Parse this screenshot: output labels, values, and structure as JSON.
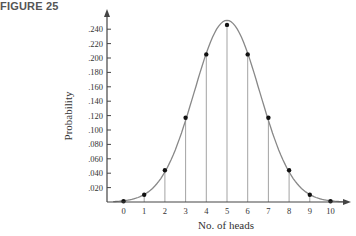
{
  "figure_label": "FIGURE 25",
  "chart_data": {
    "type": "scatter",
    "title": "",
    "xlabel": "No. of heads",
    "ylabel": "Probability",
    "x": [
      0,
      1,
      2,
      3,
      4,
      5,
      6,
      7,
      8,
      9,
      10
    ],
    "values": [
      0.001,
      0.01,
      0.044,
      0.117,
      0.205,
      0.246,
      0.205,
      0.117,
      0.044,
      0.01,
      0.001
    ],
    "x_tick_labels": [
      "0",
      "1",
      "2",
      "3",
      "4",
      "5",
      "6",
      "7",
      "8",
      "9",
      "10"
    ],
    "y_tick_labels": [
      ".020",
      ".040",
      ".060",
      ".080",
      ".100",
      ".120",
      ".140",
      ".160",
      ".180",
      ".200",
      ".220",
      ".240"
    ],
    "ylim": [
      0,
      0.25
    ],
    "xlim": [
      -0.8,
      11.5
    ],
    "grid": false,
    "drop_lines": true,
    "smooth_curve": true,
    "legend": null
  },
  "colors": {
    "axis": "#444444",
    "curve": "#888888",
    "droplines": "#999999",
    "points": "#111111"
  }
}
